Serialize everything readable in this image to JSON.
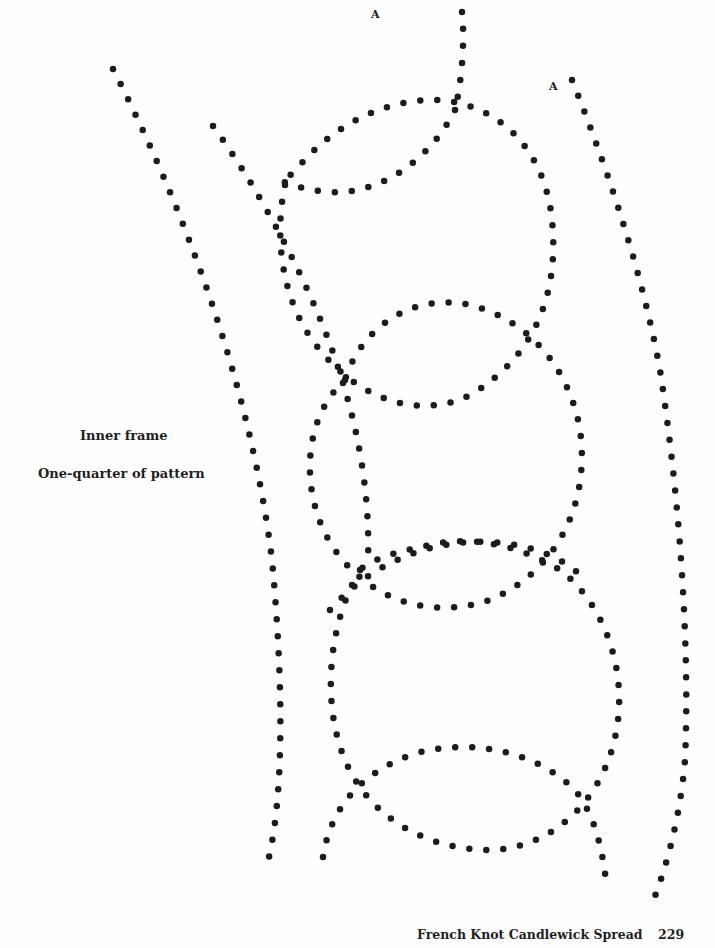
{
  "markers": [
    {
      "id": "a-left",
      "text": "A",
      "x": 371,
      "y": 8
    },
    {
      "id": "a-right",
      "text": "A",
      "x": 549,
      "y": 80
    }
  ],
  "caption": {
    "title": "Inner frame",
    "subtitle": "One-quarter of pattern"
  },
  "footer": {
    "running_title": "French Knot Candlewick Spread",
    "page_number": "229"
  },
  "colors": {
    "ink": "#1c1c1c",
    "paper": "#fefefe"
  },
  "pattern": {
    "paths": [
      {
        "name": "outer-left-frame-line",
        "d": "M113 69 C 180 200, 250 380, 272 560 C 285 700, 282 800, 269 857"
      },
      {
        "name": "inner-left-frame-line",
        "d": "M213 126 C 260 190, 320 300, 345 390 C 360 440, 370 500, 368 560"
      },
      {
        "name": "vertical-stem-top",
        "d": "M462 12 C 465 40, 462 80, 455 110"
      },
      {
        "name": "top-lens-lower-arc",
        "d": "M455 110 C 430 160, 380 195, 330 192 C 305 190, 290 185, 280 180"
      },
      {
        "name": "top-circle",
        "d": "M285 185 C 275 230, 278 300, 320 350 C 360 400, 420 420, 470 395 C 530 360, 560 300, 552 220 C 545 150, 500 105, 440 100 C 380 98, 330 130, 300 165 C 290 175, 285 180, 285 185"
      },
      {
        "name": "middle-circle",
        "d": "M345 380 C 300 420, 300 500, 335 550 C 370 600, 430 620, 490 600 C 560 570, 590 500, 580 430 C 570 370, 530 320, 470 305 C 410 292, 360 330, 345 380"
      },
      {
        "name": "bottom-circle",
        "d": "M360 570 C 330 620, 320 700, 345 760 C 370 820, 430 850, 490 850 C 560 848, 610 790, 618 720 C 625 660, 600 600, 560 570 C 520 545, 470 535, 430 545 C 395 552, 370 560, 360 570"
      },
      {
        "name": "lower-lens-arc",
        "d": "M330 610 C 360 575, 410 545, 470 542 C 520 540, 560 555, 580 575"
      },
      {
        "name": "bottom-lens-arc",
        "d": "M323 857 C 330 810, 360 770, 420 752 C 480 738, 540 755, 575 790 C 595 815, 603 850, 607 890"
      },
      {
        "name": "right-inner-frame-line",
        "d": "M572 80 C 600 150, 640 260, 660 370 C 680 500, 690 650, 685 760 C 680 820, 665 870, 655 896"
      }
    ]
  }
}
